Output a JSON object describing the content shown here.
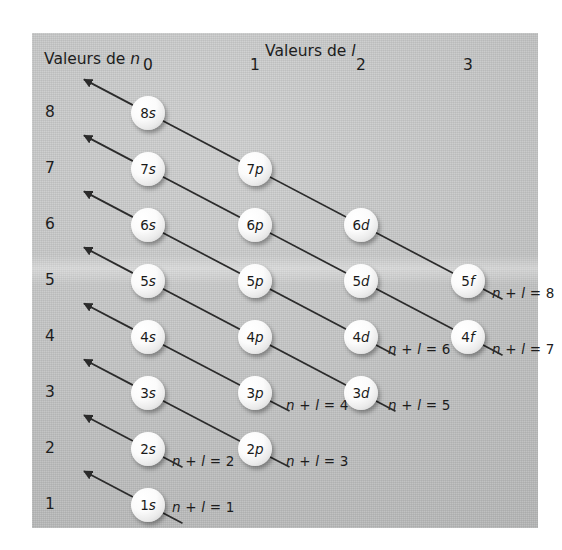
{
  "figure": {
    "kind": "klechkowski-madelung-diagram",
    "axis_labels": {
      "rows": "Valeurs de ",
      "rows_var": "n",
      "cols": "Valeurs de ",
      "cols_var": "l"
    },
    "column_headers": [
      "0",
      "1",
      "2",
      "3"
    ],
    "row_headers": [
      "8",
      "7",
      "6",
      "5",
      "4",
      "3",
      "2",
      "1"
    ],
    "orbitals": [
      {
        "label": "8s",
        "n": 8,
        "l": 0,
        "row": 0,
        "col": 0
      },
      {
        "label": "7s",
        "n": 7,
        "l": 0,
        "row": 1,
        "col": 0
      },
      {
        "label": "7p",
        "n": 7,
        "l": 1,
        "row": 1,
        "col": 1
      },
      {
        "label": "6s",
        "n": 6,
        "l": 0,
        "row": 2,
        "col": 0
      },
      {
        "label": "6p",
        "n": 6,
        "l": 1,
        "row": 2,
        "col": 1
      },
      {
        "label": "6d",
        "n": 6,
        "l": 2,
        "row": 2,
        "col": 2
      },
      {
        "label": "5s",
        "n": 5,
        "l": 0,
        "row": 3,
        "col": 0
      },
      {
        "label": "5p",
        "n": 5,
        "l": 1,
        "row": 3,
        "col": 1
      },
      {
        "label": "5d",
        "n": 5,
        "l": 2,
        "row": 3,
        "col": 2
      },
      {
        "label": "5f",
        "n": 5,
        "l": 3,
        "row": 3,
        "col": 3
      },
      {
        "label": "4s",
        "n": 4,
        "l": 0,
        "row": 4,
        "col": 0
      },
      {
        "label": "4p",
        "n": 4,
        "l": 1,
        "row": 4,
        "col": 1
      },
      {
        "label": "4d",
        "n": 4,
        "l": 2,
        "row": 4,
        "col": 2
      },
      {
        "label": "4f",
        "n": 4,
        "l": 3,
        "row": 4,
        "col": 3
      },
      {
        "label": "3s",
        "n": 3,
        "l": 0,
        "row": 5,
        "col": 0
      },
      {
        "label": "3p",
        "n": 3,
        "l": 1,
        "row": 5,
        "col": 1
      },
      {
        "label": "3d",
        "n": 3,
        "l": 2,
        "row": 5,
        "col": 2
      },
      {
        "label": "2s",
        "n": 2,
        "l": 0,
        "row": 6,
        "col": 0
      },
      {
        "label": "2p",
        "n": 2,
        "l": 1,
        "row": 6,
        "col": 1
      },
      {
        "label": "1s",
        "n": 1,
        "l": 0,
        "row": 7,
        "col": 0
      }
    ],
    "sum_annotations": [
      {
        "text": " + ",
        "lhs": "n",
        "rhs": "l",
        "eq": "= 1",
        "value": 1,
        "x": 172,
        "y": 507
      },
      {
        "text": " + ",
        "lhs": "n",
        "rhs": "l",
        "eq": "= 2",
        "value": 2,
        "x": 172,
        "y": 461
      },
      {
        "text": " + ",
        "lhs": "n",
        "rhs": "l",
        "eq": "= 3",
        "value": 3,
        "x": 286,
        "y": 461
      },
      {
        "text": " + ",
        "lhs": "n",
        "rhs": "l",
        "eq": "= 4",
        "value": 4,
        "x": 286,
        "y": 405
      },
      {
        "text": " + ",
        "lhs": "n",
        "rhs": "l",
        "eq": "= 5",
        "value": 5,
        "x": 388,
        "y": 405
      },
      {
        "text": " + ",
        "lhs": "n",
        "rhs": "l",
        "eq": "= 6",
        "value": 6,
        "x": 388,
        "y": 349
      },
      {
        "text": " + ",
        "lhs": "n",
        "rhs": "l",
        "eq": "= 7",
        "value": 7,
        "x": 492,
        "y": 349
      },
      {
        "text": " + ",
        "lhs": "n",
        "rhs": "l",
        "eq": "= 8",
        "value": 8,
        "x": 492,
        "y": 293
      }
    ],
    "colors": {
      "panel": "#c6c7c7",
      "ink": "#1d1d1d",
      "orb_fill": "#ffffff",
      "line": "#2b2b2b"
    }
  }
}
